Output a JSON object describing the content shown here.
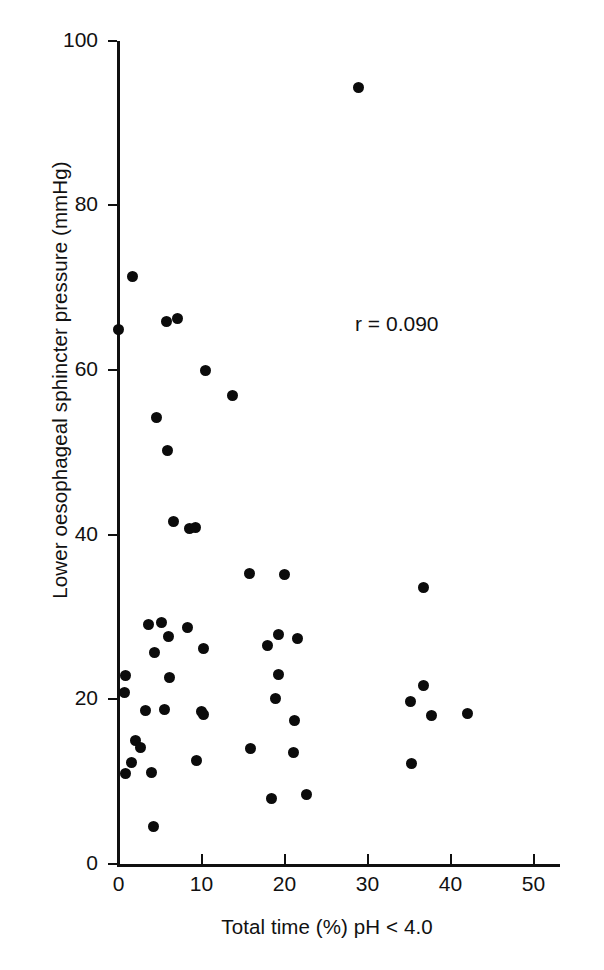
{
  "chart_data": {
    "type": "scatter",
    "title": "",
    "xlabel": "Total time (%) pH < 4.0",
    "ylabel": "Lower oesophageal sphincter pressure (mmHg)",
    "xlim": [
      0,
      53.5
    ],
    "ylim": [
      0,
      100
    ],
    "xticks": [
      0,
      10,
      20,
      30,
      40,
      50
    ],
    "xticklabels": [
      "0",
      "10",
      "20",
      "30",
      "40",
      "50"
    ],
    "yticks": [
      0,
      20,
      40,
      60,
      80,
      100
    ],
    "yticklabels": [
      "0",
      "20",
      "40",
      "60",
      "80",
      "100"
    ],
    "grid": false,
    "legend": null,
    "marker": "filled-circle",
    "marker_color": "#0b0b0b",
    "annotations": [
      {
        "text": "r = 0.090",
        "x": 28.5,
        "y": 65.5
      }
    ],
    "points": [
      {
        "x": 1.7,
        "y": 71.4
      },
      {
        "x": 0.0,
        "y": 64.9
      },
      {
        "x": 5.8,
        "y": 65.9
      },
      {
        "x": 7.1,
        "y": 66.3
      },
      {
        "x": 10.5,
        "y": 60.0
      },
      {
        "x": 13.7,
        "y": 56.9
      },
      {
        "x": 4.6,
        "y": 54.2
      },
      {
        "x": 5.9,
        "y": 50.2
      },
      {
        "x": 6.6,
        "y": 41.6
      },
      {
        "x": 8.5,
        "y": 40.7
      },
      {
        "x": 9.3,
        "y": 40.9
      },
      {
        "x": 15.8,
        "y": 35.3
      },
      {
        "x": 20.0,
        "y": 35.2
      },
      {
        "x": 36.8,
        "y": 33.6
      },
      {
        "x": 28.9,
        "y": 94.3
      },
      {
        "x": 3.6,
        "y": 29.1
      },
      {
        "x": 5.2,
        "y": 29.3
      },
      {
        "x": 8.3,
        "y": 28.7
      },
      {
        "x": 6.0,
        "y": 27.6
      },
      {
        "x": 19.3,
        "y": 27.9
      },
      {
        "x": 21.6,
        "y": 27.4
      },
      {
        "x": 4.3,
        "y": 25.7
      },
      {
        "x": 10.2,
        "y": 26.2
      },
      {
        "x": 17.9,
        "y": 26.5
      },
      {
        "x": 0.9,
        "y": 22.9
      },
      {
        "x": 6.2,
        "y": 22.7
      },
      {
        "x": 19.3,
        "y": 23.0
      },
      {
        "x": 36.7,
        "y": 21.7
      },
      {
        "x": 0.7,
        "y": 20.8
      },
      {
        "x": 18.9,
        "y": 20.1
      },
      {
        "x": 35.2,
        "y": 19.7
      },
      {
        "x": 42.1,
        "y": 18.3
      },
      {
        "x": 37.7,
        "y": 18.0
      },
      {
        "x": 3.3,
        "y": 18.6
      },
      {
        "x": 5.6,
        "y": 18.8
      },
      {
        "x": 10.0,
        "y": 18.5
      },
      {
        "x": 10.3,
        "y": 18.2
      },
      {
        "x": 21.2,
        "y": 17.4
      },
      {
        "x": 2.0,
        "y": 15.0
      },
      {
        "x": 2.6,
        "y": 14.2
      },
      {
        "x": 15.9,
        "y": 14.0
      },
      {
        "x": 21.1,
        "y": 13.6
      },
      {
        "x": 35.3,
        "y": 12.2
      },
      {
        "x": 1.6,
        "y": 12.3
      },
      {
        "x": 4.0,
        "y": 11.1
      },
      {
        "x": 0.8,
        "y": 11.0
      },
      {
        "x": 9.4,
        "y": 12.6
      },
      {
        "x": 18.4,
        "y": 8.0
      },
      {
        "x": 22.6,
        "y": 8.5
      },
      {
        "x": 4.2,
        "y": 4.6
      }
    ]
  },
  "axes": {
    "x_title": "Total time (%) pH < 4.0",
    "y_title": "Lower oesophageal sphincter pressure (mmHg)",
    "x_tick_labels": [
      "0",
      "10",
      "20",
      "30",
      "40",
      "50"
    ],
    "y_tick_labels": [
      "0",
      "20",
      "40",
      "60",
      "80",
      "100"
    ]
  },
  "annotation": {
    "correlation_text": "r = 0.090"
  },
  "style": {
    "background": "#ffffff",
    "ink": "#111111",
    "marker_color": "#0b0b0b"
  }
}
